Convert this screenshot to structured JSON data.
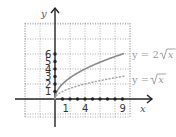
{
  "chart_data": {
    "type": "line",
    "title": "",
    "xlabel": "x",
    "ylabel": "y",
    "xlim": [
      -4,
      10
    ],
    "ylim": [
      -2.4,
      10.1
    ],
    "grid": true,
    "grid_step": 2,
    "x_tick_labels": [
      "1",
      "4",
      "9"
    ],
    "x_tick_values": [
      1,
      4,
      9
    ],
    "x_dot_values": [
      1,
      2,
      3,
      4,
      5,
      6,
      7,
      8,
      9
    ],
    "y_tick_labels": [
      "1",
      "2",
      "3",
      "4",
      "5",
      "6"
    ],
    "y_tick_values": [
      1,
      2,
      3,
      4,
      5,
      6
    ],
    "series": [
      {
        "name": "y = 2√x",
        "label_prefix": "y = 2",
        "label_radicand": "x",
        "style": "solid",
        "color": "#8a8a8a",
        "coefficient": 2,
        "x_range": [
          0,
          9.2
        ]
      },
      {
        "name": "y = √x",
        "label_prefix": "y = ",
        "label_radicand": "x",
        "style": "dotted",
        "color": "#a8a8a8",
        "coefficient": 1,
        "x_range": [
          0,
          9.2
        ]
      }
    ]
  },
  "colors": {
    "axis": "#222222",
    "grid": "#9a9a9a",
    "dot": "#222222"
  }
}
